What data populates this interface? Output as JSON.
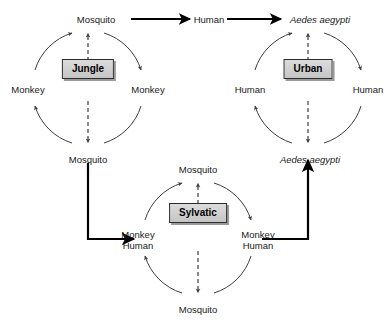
{
  "figure": {
    "type": "cycle-diagram",
    "background_color": "#ffffff",
    "line_color": "#3c3c3c",
    "bold_arrow_color": "#000000",
    "box_fill_color": "#d2d2d2",
    "box_border_color": "#2b2b2b",
    "box_shadow_color": "#9a9a9a",
    "text_color": "#1a1a1a"
  },
  "top_chain": {
    "items": [
      {
        "label": "Mosquito",
        "italic": false
      },
      {
        "label": "Human",
        "italic": false
      },
      {
        "label": "Aedes aegypti",
        "italic": true
      }
    ],
    "arrow_1_label": "",
    "arrow_2_label": ""
  },
  "cycles": [
    {
      "id": "jungle",
      "box_label": "Jungle",
      "top_label": "Mosquito",
      "top_italic": false,
      "left_label": "Monkey",
      "left_italic": false,
      "right_label": "Monkey",
      "right_italic": false,
      "bottom_label": "Mosquito",
      "bottom_italic": false
    },
    {
      "id": "urban",
      "box_label": "Urban",
      "top_label": "Aedes aegypti",
      "top_italic": true,
      "left_label": "Human",
      "left_italic": false,
      "right_label": "Human",
      "right_italic": false,
      "bottom_label": "Aedes aegypti",
      "bottom_italic": true
    },
    {
      "id": "sylvatic",
      "box_label": "Sylvatic",
      "top_label": "Mosquito",
      "top_italic": false,
      "left_label_line1": "Monkey",
      "left_label_line2": "Human",
      "right_label_line1": "Monkey",
      "right_label_line2": "Human",
      "bottom_label": "Mosquito",
      "bottom_italic": false
    }
  ],
  "connectors": [
    {
      "id": "jungle-to-sylvatic",
      "from": "Mosquito",
      "to": "Monkey Human",
      "style": "bold-elbow"
    },
    {
      "id": "sylvatic-to-urban",
      "from": "Monkey Human",
      "to": "Aedes aegypti",
      "style": "bold-elbow"
    }
  ]
}
